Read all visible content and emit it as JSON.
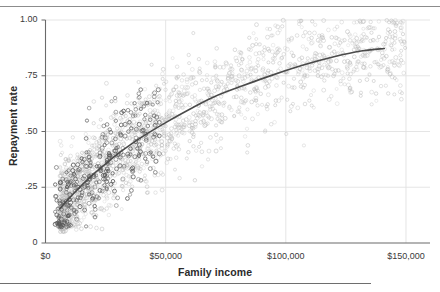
{
  "chart_data": {
    "type": "scatter",
    "title": "",
    "xlabel": "Family income",
    "ylabel": "Repayment rate",
    "xlim": [
      0,
      160000
    ],
    "ylim": [
      0,
      1.0
    ],
    "grid": true,
    "legend": null,
    "xticks": [
      {
        "value": 0,
        "label": "$0"
      },
      {
        "value": 50000,
        "label": "$50,000"
      },
      {
        "value": 100000,
        "label": "$100,000"
      },
      {
        "value": 150000,
        "label": "$150,000"
      }
    ],
    "yticks": [
      {
        "value": 0,
        "label": "0"
      },
      {
        "value": 0.25,
        "label": ".25"
      },
      {
        "value": 0.5,
        "label": ".50"
      },
      {
        "value": 0.75,
        "label": ".75"
      },
      {
        "value": 1.0,
        "label": "1.00"
      }
    ],
    "marker": "open-circle",
    "series": [
      {
        "name": "low-income-cluster",
        "color": "#5a5a5a",
        "marker": "open-circle",
        "n_points": 300,
        "x_range": [
          4000,
          48000
        ],
        "y_range": [
          0.08,
          0.68
        ],
        "x_mean": 22000,
        "y_mean": 0.33
      },
      {
        "name": "main-cloud",
        "color": "#b9b9b9",
        "marker": "open-circle",
        "n_points": 1700,
        "x_range": [
          6000,
          150000
        ],
        "y_range": [
          0.06,
          1.0
        ],
        "x_mean": 58000,
        "y_mean": 0.61
      }
    ],
    "trendline": {
      "name": "fitted-curve",
      "color": "#4a4a4a",
      "width": 1.6,
      "points": [
        {
          "x": 6000,
          "y": 0.155
        },
        {
          "x": 12000,
          "y": 0.225
        },
        {
          "x": 18000,
          "y": 0.29
        },
        {
          "x": 25000,
          "y": 0.355
        },
        {
          "x": 32000,
          "y": 0.415
        },
        {
          "x": 40000,
          "y": 0.475
        },
        {
          "x": 50000,
          "y": 0.54
        },
        {
          "x": 60000,
          "y": 0.6
        },
        {
          "x": 70000,
          "y": 0.655
        },
        {
          "x": 82000,
          "y": 0.705
        },
        {
          "x": 95000,
          "y": 0.755
        },
        {
          "x": 108000,
          "y": 0.8
        },
        {
          "x": 120000,
          "y": 0.835
        },
        {
          "x": 132000,
          "y": 0.862
        },
        {
          "x": 141000,
          "y": 0.872
        }
      ]
    }
  },
  "axes": {
    "x_title": "Family income",
    "y_title": "Repayment rate"
  }
}
